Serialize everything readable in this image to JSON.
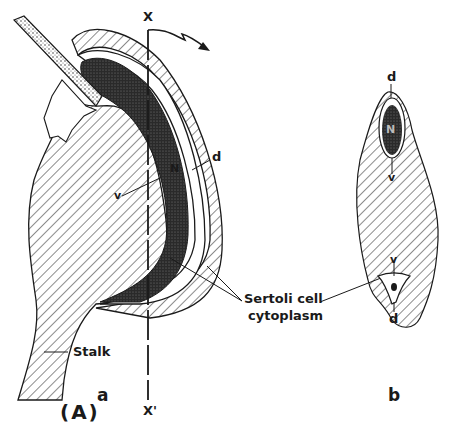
{
  "figure": {
    "panel_label": "(A)",
    "subfigures": [
      {
        "id": "a",
        "label": "a",
        "axis_top_label": "X",
        "axis_bottom_label": "X'",
        "nucleus_label": "N",
        "dorsal_label": "d",
        "ventral_label": "v",
        "stalk_label": "Stalk"
      },
      {
        "id": "b",
        "label": "b",
        "nucleus_label": "N",
        "dorsal_top_label": "d",
        "ventral_top_label": "v",
        "ventral_bottom_label": "v",
        "dorsal_bottom_label": "d"
      }
    ],
    "shared_label_line1": "Sertoli cell",
    "shared_label_line2": "cytoplasm"
  },
  "colors": {
    "ink": "#1a1a1a",
    "background": "#ffffff",
    "stipple": "#555555",
    "dense": "#2a2a2a"
  }
}
